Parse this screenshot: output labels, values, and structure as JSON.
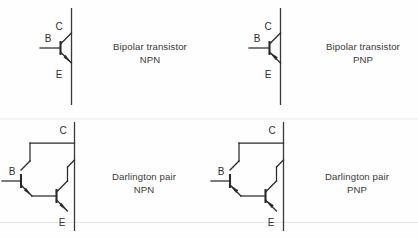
{
  "page": {
    "background_color": "#fefefe",
    "ink_color": "#2b2b2b",
    "width": 418,
    "height": 238
  },
  "terminals": {
    "collector": "C",
    "base": "B",
    "emitter": "E"
  },
  "symbols": [
    {
      "id": "bipolar-npn",
      "type": "bipolar",
      "polarity": "NPN",
      "arrow_direction": "outward",
      "caption_line1": "Bipolar transistor",
      "caption_line2": "NPN",
      "labels": {
        "collector": "C",
        "base": "B",
        "emitter": "E"
      }
    },
    {
      "id": "bipolar-pnp",
      "type": "bipolar",
      "polarity": "PNP",
      "arrow_direction": "inward",
      "caption_line1": "Bipolar transistor",
      "caption_line2": "PNP",
      "labels": {
        "collector": "C",
        "base": "B",
        "emitter": "E"
      }
    },
    {
      "id": "darlington-npn",
      "type": "darlington",
      "polarity": "NPN",
      "arrow_direction": "outward",
      "caption_line1": "Darlington pair",
      "caption_line2": "NPN",
      "labels": {
        "collector": "C",
        "base": "B",
        "emitter": "E"
      }
    },
    {
      "id": "darlington-pnp",
      "type": "darlington",
      "polarity": "PNP",
      "arrow_direction": "inward",
      "caption_line1": "Darlington pair",
      "caption_line2": "PNP",
      "labels": {
        "collector": "C",
        "base": "B",
        "emitter": "E"
      }
    }
  ]
}
